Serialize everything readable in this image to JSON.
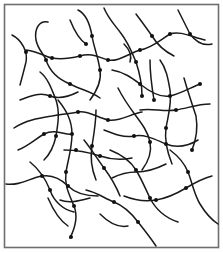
{
  "figure": {
    "width": 223,
    "height": 253,
    "background": "#ffffff",
    "frame": {
      "x": 4.5,
      "y": 4.5,
      "w": 214,
      "h": 243,
      "color": "#6e6e6e"
    },
    "line_color": "#1a1a1a",
    "node_color": "#111111"
  },
  "chains": [
    "M12,35 C22,40 28,52 26,62 C24,70 22,78 20,85",
    "M26,50 C40,52 48,58 52,58 C62,60 72,58 80,56 C92,52 100,58 108,60 C118,62 128,54 140,50 C152,48 160,40 170,34 C180,30 194,38 205,40",
    "M48,22 C40,20 34,28 36,40 C38,50 44,54 46,60 C50,72 60,80 70,84 C82,90 92,92 100,98",
    "M78,10 C86,14 90,24 92,36 C94,48 98,56 100,70 C102,82 96,92 90,100",
    "M70,20 C74,30 80,40 86,44",
    "M58,100 C66,110 72,120 72,134 C72,148 68,160 66,172 C64,186 70,196 74,206 C78,216 76,226 70,238",
    "M20,100 C30,96 40,92 50,96 C60,100 70,96 78,92",
    "M14,128 C26,120 40,118 52,116 C62,114 70,114 78,112 C88,110 98,118 108,120 C120,122 130,114 142,112",
    "M18,150 C28,146 34,140 44,134 C56,128 66,136 72,134",
    "M6,184 C20,186 30,178 42,176 C54,174 62,180 68,186 C76,194 88,196 98,196",
    "M30,162 C40,170 46,180 50,190 C54,202 64,210 74,212",
    "M40,72 C48,78 52,90 56,100 C60,112 58,124 56,136 C54,146 50,154 44,160",
    "M104,8 C108,18 114,24 120,32 C128,42 132,52 136,62 C140,74 142,86 142,96",
    "M136,14 C142,22 148,30 152,36 C158,46 166,52 174,56",
    "M178,10 C182,18 186,26 190,34 C196,42 204,46 212,44",
    "M112,70 C124,72 132,78 140,84 C150,92 160,98 170,96 C180,94 190,88 200,84",
    "M118,88 C124,100 130,108 136,116 C142,124 148,132 150,142 C152,152 148,162 142,170",
    "M160,60 C166,68 168,78 170,90 C172,104 168,116 166,128 C164,142 168,154 172,164",
    "M184,78 C188,92 192,104 196,116 C198,128 196,140 192,150",
    "M140,110 C152,108 164,112 176,110 C188,108 198,104 210,104",
    "M104,130 C114,134 124,138 134,136 C146,134 156,140 166,144 C176,148 188,146 198,140",
    "M84,140 C92,150 98,160 104,168 C110,176 116,186 120,196",
    "M96,110 C96,122 94,134 92,146 C90,158 92,170 96,180",
    "M110,150 C120,154 130,160 136,170 C142,180 146,190 150,198 C156,210 166,218 178,222",
    "M170,150 C178,156 184,162 188,172 C192,182 194,194 200,204 C206,214 212,220 218,224",
    "M124,196 C134,200 144,202 156,200 C168,198 176,194 186,188 C196,182 204,178 212,176",
    "M86,190 C96,192 104,198 114,202 C124,206 132,214 138,222 C146,232 152,240 156,246",
    "M112,178 C120,174 128,172 136,172 C148,172 158,168 166,164",
    "M100,214 C108,222 118,228 128,226",
    "M60,200 C70,204 82,200 90,198",
    "M150,60 C150,74 152,88 154,100",
    "M124,44 C130,50 132,56 130,62",
    "M64,150 C76,150 88,152 100,156 C112,160 122,160 132,158",
    "M48,198 C54,212 62,222 68,226"
  ],
  "nodes": [
    [
      26,
      52
    ],
    [
      52,
      58
    ],
    [
      80,
      56
    ],
    [
      108,
      60
    ],
    [
      140,
      50
    ],
    [
      170,
      34
    ],
    [
      46,
      60
    ],
    [
      70,
      84
    ],
    [
      92,
      36
    ],
    [
      100,
      70
    ],
    [
      86,
      44
    ],
    [
      72,
      134
    ],
    [
      66,
      172
    ],
    [
      74,
      206
    ],
    [
      50,
      96
    ],
    [
      78,
      112
    ],
    [
      108,
      120
    ],
    [
      44,
      134
    ],
    [
      42,
      176
    ],
    [
      68,
      186
    ],
    [
      50,
      190
    ],
    [
      56,
      136
    ],
    [
      136,
      62
    ],
    [
      142,
      96
    ],
    [
      152,
      36
    ],
    [
      190,
      34
    ],
    [
      140,
      84
    ],
    [
      170,
      96
    ],
    [
      200,
      84
    ],
    [
      150,
      142
    ],
    [
      166,
      128
    ],
    [
      192,
      150
    ],
    [
      176,
      110
    ],
    [
      134,
      136
    ],
    [
      166,
      144
    ],
    [
      104,
      168
    ],
    [
      92,
      146
    ],
    [
      136,
      170
    ],
    [
      188,
      172
    ],
    [
      156,
      200
    ],
    [
      186,
      188
    ],
    [
      114,
      202
    ],
    [
      138,
      222
    ],
    [
      150,
      198
    ],
    [
      154,
      100
    ],
    [
      100,
      156
    ],
    [
      76,
      150
    ],
    [
      71,
      237
    ]
  ]
}
